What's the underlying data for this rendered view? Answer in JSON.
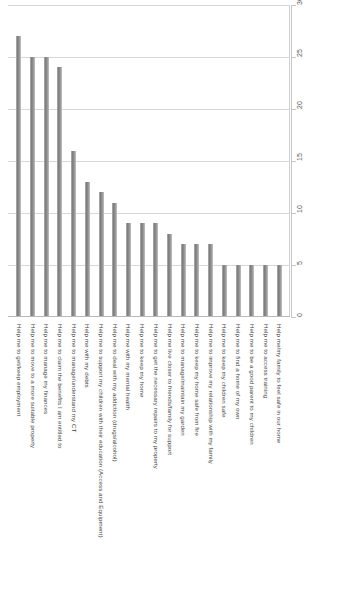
{
  "chart_data": {
    "type": "bar",
    "title": "",
    "subtitle": "",
    "xlabel": "",
    "ylabel": "",
    "orientation": "vertical-rotated",
    "grid": true,
    "legend": false,
    "legend_position": "none",
    "ylim": [
      0,
      30
    ],
    "yticks": [
      0,
      5,
      10,
      15,
      20,
      25,
      30
    ],
    "ytick_labels": [
      "0",
      "5",
      "10",
      "15",
      "20",
      "25",
      "30"
    ],
    "bar_color": "#8c8c8c",
    "gridline_color": "#d8d8d8",
    "categories": [
      "Help me to get/keep employment",
      "Help me to move to a more suitable property",
      "Help me to manage my finances",
      "Help me to claim the benefits I am entitled to",
      "Help me to manage/understand my CT",
      "Help me with my debts",
      "Help me to support my children with their education (Access and Equipment)",
      "Help me to deal with my addiction (drugs/alcohol)",
      "Help me with my mental health",
      "Help me to keep my home",
      "Help me to get the necessary repairs to my property",
      "Help me live closer to friends/family for support",
      "Help me to manage/maintain my garden",
      "Help me to keep my home safe from fire",
      "Help me to improve my relationship with my family",
      "Help me to keep my children safe",
      "Help me to find a home of my own",
      "Help me to be a good parent to my children",
      "Help me to access training",
      "Help me/my family to feel safe in our home"
    ],
    "values": [
      27,
      25,
      25,
      24,
      16,
      13,
      12,
      11,
      9,
      9,
      9,
      8,
      7,
      7,
      7,
      5,
      5,
      5,
      5,
      5
    ]
  }
}
